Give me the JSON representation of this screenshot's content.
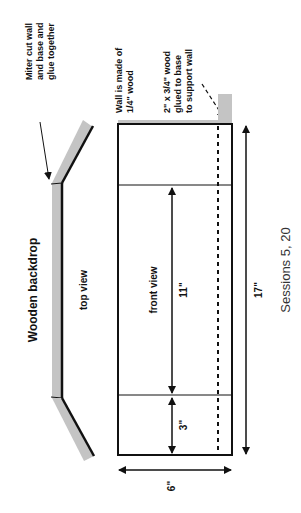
{
  "title": "Wooden backdrop",
  "top_view": {
    "label": "top view",
    "annotation": [
      "Miter cut wall",
      "and base and",
      "glue together"
    ]
  },
  "front_view": {
    "label": "front view",
    "wall_note": [
      "Wall is made of",
      "1/4\" wood"
    ],
    "support_note": [
      "2\" x 3/4\" wood",
      "glued to base",
      "to support wall"
    ],
    "dimensions": {
      "center_height": "11\"",
      "end_height": "3\"",
      "total_length": "17\"",
      "depth": "6\""
    }
  },
  "footer": "Sessions 5, 20",
  "colors": {
    "wood_gray": "#c4c4c4",
    "line": "#111111"
  }
}
